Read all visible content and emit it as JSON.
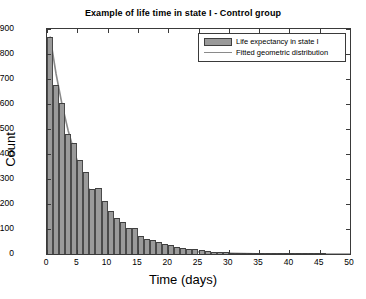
{
  "chart_data": {
    "type": "bar",
    "title": "Example of life time in state I - Control group",
    "xlabel": "Time (days)",
    "ylabel": "Count",
    "xlim": [
      0,
      50
    ],
    "ylim": [
      0,
      900
    ],
    "xticks": [
      0,
      5,
      10,
      15,
      20,
      25,
      30,
      35,
      40,
      45,
      50
    ],
    "yticks": [
      0,
      100,
      200,
      300,
      400,
      500,
      600,
      700,
      800,
      900
    ],
    "grid": false,
    "legend_position": "top-right",
    "legend": [
      "Life expectancy in state I",
      "Fitted geometric distribution"
    ],
    "series": [
      {
        "name": "Life expectancy in state I",
        "type": "bar",
        "color": "#9a9a9a",
        "edge_color": "#3f3f3f",
        "bin_width": 1,
        "x": [
          0,
          1,
          2,
          3,
          4,
          5,
          6,
          7,
          8,
          9,
          10,
          11,
          12,
          13,
          14,
          15,
          16,
          17,
          18,
          19,
          20,
          21,
          22,
          23,
          24,
          25,
          26,
          27,
          28,
          29,
          30,
          31,
          32,
          33,
          34,
          35,
          36,
          37,
          38,
          39,
          40,
          41,
          42,
          43,
          44,
          45,
          46,
          47,
          48,
          49
        ],
        "values": [
          870,
          675,
          605,
          480,
          445,
          375,
          330,
          262,
          265,
          212,
          172,
          145,
          128,
          105,
          105,
          72,
          60,
          55,
          48,
          40,
          36,
          30,
          25,
          21,
          19,
          16,
          13,
          10,
          8,
          7,
          6,
          5,
          4,
          4,
          3,
          3,
          2,
          2,
          2,
          1,
          1,
          1,
          1,
          1,
          1,
          1,
          0,
          0,
          0,
          0
        ]
      },
      {
        "name": "Fitted geometric distribution",
        "type": "line",
        "color": "#8a8a8a",
        "x": [
          0,
          1,
          2,
          3,
          4,
          5,
          6,
          7,
          8,
          9,
          10,
          11,
          12,
          13,
          14,
          15,
          16,
          17,
          18,
          19,
          20,
          21,
          22,
          23,
          24,
          25,
          26,
          27,
          28,
          29,
          30,
          32,
          34,
          36,
          38,
          40,
          42,
          44,
          46,
          48,
          50
        ],
        "values": [
          870,
          720,
          596,
          493,
          408,
          338,
          280,
          232,
          192,
          159,
          131,
          109,
          90,
          74,
          62,
          51,
          42,
          35,
          29,
          24,
          20,
          16,
          14,
          11,
          9,
          8,
          6,
          5,
          4,
          4,
          3,
          2,
          1,
          1,
          1,
          0,
          0,
          0,
          0,
          0,
          0
        ]
      }
    ]
  },
  "figure": {
    "background_color": "#ffffff",
    "axis_color": "#3a3a3a"
  }
}
